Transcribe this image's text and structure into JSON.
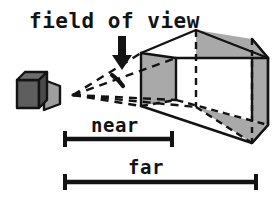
{
  "figure": {
    "title": "field of view",
    "kind": "view-frustum-diagram",
    "background": "#ffffff",
    "ink": "#131313"
  },
  "labels": {
    "title": "field of view",
    "near": "near",
    "far": "far"
  },
  "colors": {
    "ink": "#131313",
    "camera_body": "#5e5e5e",
    "camera_body_top": "#6e6e6e",
    "camera_body_side": "#4a4a4a",
    "camera_lens": "#9e9e9e",
    "frustum_shaded": "#a9a9a9",
    "frustum_light": "#ffffff",
    "background": "#ffffff"
  },
  "annotations": {
    "arrow": {
      "name": "field-of-view-arrow",
      "direction": "down",
      "x": 122,
      "y_top": 36,
      "y_tip": 67
    },
    "angle_arc": {
      "name": "field-of-view-angle-arc",
      "apex_x": 73,
      "apex_y": 95
    }
  },
  "camera": {
    "name": "camera",
    "apex": {
      "x": 73,
      "y": 95
    },
    "body": {
      "x": 16,
      "y": 74,
      "w": 30,
      "h": 30
    }
  },
  "frustum": {
    "name": "view-frustum",
    "near_plane": {
      "x": 141,
      "top": 53,
      "bottom": 106
    },
    "far_plane": {
      "x": 252,
      "top": 39,
      "bottom": 143
    }
  },
  "measures": [
    {
      "name": "near-measure",
      "label": "near",
      "x_start": 64,
      "x_end": 173,
      "y": 139,
      "label_y": 130
    },
    {
      "name": "far-measure",
      "label": "far",
      "x_start": 64,
      "x_end": 257,
      "y": 182,
      "label_y": 172
    }
  ]
}
